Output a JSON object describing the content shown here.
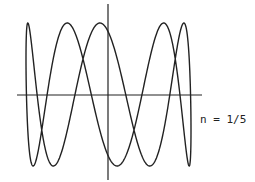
{
  "chart_data": {
    "type": "line",
    "title": "",
    "xlabel": "",
    "ylabel": "",
    "annotation": "n = 1/5",
    "grid": false,
    "legend": null,
    "series": [
      {
        "name": "curve",
        "parametric": {
          "x": "cos(t)",
          "y": "sin(5t + 0.52)",
          "t_range": [
            0,
            6.2832
          ],
          "direction_note": "x mapped so cos(t)=1 is left edge"
        },
        "maxima_x_px": [
          29,
          72,
          96,
          167,
          182
        ],
        "minima_x_px": [
          36,
          52,
          125,
          147,
          190
        ]
      }
    ],
    "xlim": [
      -1,
      1
    ],
    "ylim": [
      -1,
      1
    ],
    "stroke_color": "#222222"
  },
  "layout": {
    "x_axis": {
      "x1": 17,
      "x2": 202,
      "y": 95
    },
    "y_axis": {
      "x": 108,
      "y1": 4,
      "y2": 180
    },
    "curve_center": {
      "cx": 108.5,
      "cy": 94.5
    },
    "curve_amp": {
      "ax": 82.5,
      "ay": 71.5
    }
  },
  "label": {
    "text": "n = 1/5"
  }
}
